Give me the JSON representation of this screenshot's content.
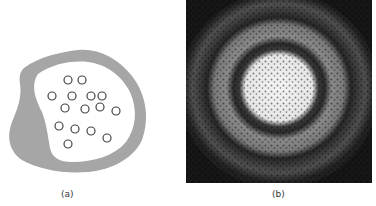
{
  "figure": {
    "panel_a": {
      "caption": "(a)",
      "outer_fill": "#a6a6a6",
      "inner_fill": "#ffffff",
      "circle_stroke": "#444444",
      "circle_count": 15
    },
    "panel_b": {
      "caption": "(b)",
      "background": "#161616",
      "core_color": "#f2f2f2"
    }
  }
}
